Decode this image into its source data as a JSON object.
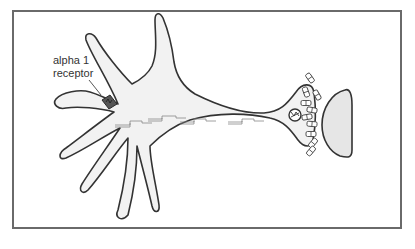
{
  "diagram": {
    "labels": {
      "receptor": {
        "line1": "alpha 1",
        "line2": "receptor"
      }
    },
    "components": [
      "neuron-cell-body",
      "dendrites",
      "axon",
      "axon-terminal",
      "alpha-1-receptor",
      "action-potential-signals",
      "mitochondrion",
      "synaptic-vesicles",
      "postsynaptic-cell"
    ],
    "signal_count": 4,
    "vesicle_count": 12,
    "colors": {
      "frame": "#6a6a6a",
      "cell_fill": "#f2f2f2",
      "outline": "#333333",
      "postsynaptic_fill": "#e6e6e6",
      "receptor": "#555555"
    }
  }
}
